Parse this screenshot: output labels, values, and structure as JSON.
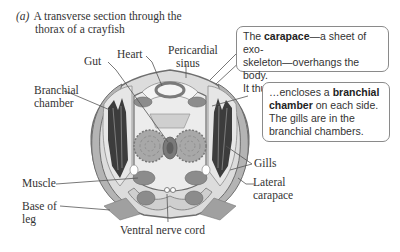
{
  "caption": {
    "letter": "(a)",
    "line1": "A transverse section through the",
    "line2": "thorax of a crayfish"
  },
  "labels": {
    "gut": "Gut",
    "heart": "Heart",
    "pericardial_sinus_1": "Pericardial",
    "pericardial_sinus_2": "sinus",
    "branchial_chamber_1": "Branchial",
    "branchial_chamber_2": "chamber",
    "gills": "Gills",
    "muscle": "Muscle",
    "base_of_leg_1": "Base of",
    "base_of_leg_2": "leg",
    "lateral_carapace_1": "Lateral",
    "lateral_carapace_2": "carapace",
    "ventral_nerve_cord": "Ventral nerve cord"
  },
  "callouts": {
    "carapace": {
      "pre": "The ",
      "bold": "carapace",
      "line1_post": "—a sheet of exo-",
      "line2": "skeleton—overhangs the body.",
      "line3": "It thus…"
    },
    "branchial": {
      "pre": "…encloses a ",
      "bold1": "branchial",
      "bold2": "chamber",
      "line2_post": " on each side.",
      "line3": "The gills are in the",
      "line4": "branchial chambers."
    }
  },
  "colors": {
    "tissue_light": "#dcdcdc",
    "tissue_mid": "#b4b4b4",
    "tissue_dark": "#8c8c8c",
    "outline": "#6e6e6e",
    "gill_dark": "#3c3c3c",
    "leader_line": "#555555"
  }
}
